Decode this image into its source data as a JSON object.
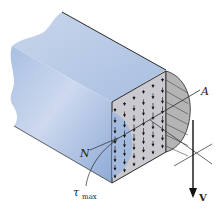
{
  "figure": {
    "labels": {
      "point_a": "A",
      "neutral_axis": "N",
      "tau": "τ",
      "tau_sub": "max",
      "shear_force": "V"
    },
    "colors": {
      "beam_face": "#9db8dc",
      "beam_top": "#b7cbe6",
      "section_face": "#c4c4c4",
      "stress_region": "#b0b0b0",
      "line": "#2a2a2a"
    }
  }
}
